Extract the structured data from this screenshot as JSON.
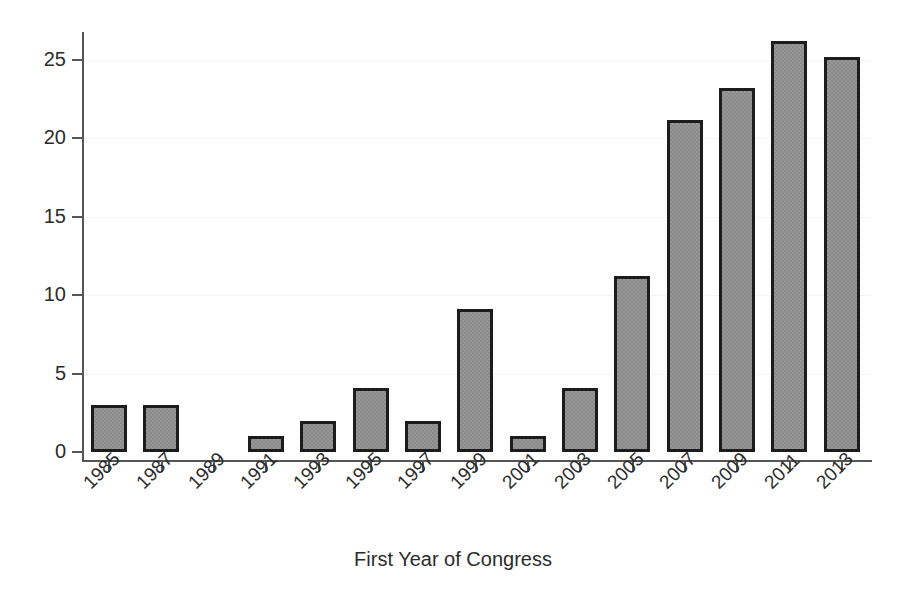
{
  "chart_data": {
    "type": "bar",
    "title": "",
    "subtitle": "",
    "xlabel": "First Year of Congress",
    "ylabel": "",
    "categories": [
      "1985",
      "1987",
      "1989",
      "1991",
      "1993",
      "1995",
      "1997",
      "1999",
      "2001",
      "2003",
      "2005",
      "2007",
      "2009",
      "2011",
      "2013"
    ],
    "values": [
      3.0,
      3.0,
      0.0,
      1.0,
      2.0,
      4.1,
      2.0,
      9.1,
      1.0,
      4.1,
      11.2,
      21.2,
      23.2,
      26.2,
      25.2
    ],
    "series": [
      {
        "name": "Count",
        "values": [
          3.0,
          3.0,
          0.0,
          1.0,
          2.0,
          4.1,
          2.0,
          9.1,
          1.0,
          4.1,
          11.2,
          21.2,
          23.2,
          26.2,
          25.2
        ]
      }
    ],
    "ylim": [
      0,
      26.8
    ],
    "xlim": [
      0,
      15
    ],
    "y_ticks": [
      0,
      5,
      10,
      15,
      20,
      25
    ],
    "y_tick_labels": [
      "0",
      "5",
      "10",
      "15",
      "20",
      "25"
    ],
    "x_tick_labels": [
      "1985",
      "1987",
      "1989",
      "1991",
      "1993",
      "1995",
      "1997",
      "1999",
      "2001",
      "2003",
      "2005",
      "2007",
      "2009",
      "2011",
      "2013"
    ],
    "x_tick_label_rotation": -45,
    "grid": true,
    "grid_axis": "y",
    "legend": false,
    "legend_position": "none",
    "bar_fill_color": "#8a8a8a",
    "bar_edge_color": "#1c1c1c",
    "axis_color": "#555555",
    "text_color": "#2b2b2b",
    "background_color": "#ffffff",
    "annotations": []
  }
}
